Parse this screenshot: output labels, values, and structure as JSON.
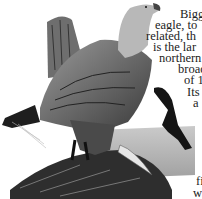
{
  "page": {
    "illustration": {
      "subject": "white-tailed eagle perched on rock with fish, second eagle in flight",
      "style": "grayscale engraving"
    },
    "text_lines": [
      {
        "text": "Bigg",
        "x": 180,
        "y": 8
      },
      {
        "text": "eagle, to",
        "x": 155,
        "y": 19
      },
      {
        "text": "related, th",
        "x": 146,
        "y": 30
      },
      {
        "text": "is the lar",
        "x": 153,
        "y": 41
      },
      {
        "text": "northern",
        "x": 159,
        "y": 52
      },
      {
        "text": "broad",
        "x": 178,
        "y": 63
      },
      {
        "text": "of 1",
        "x": 184,
        "y": 74
      },
      {
        "text": "Its a",
        "x": 187,
        "y": 86
      },
      {
        "text": "a",
        "x": 193,
        "y": 97
      },
      {
        "text": "fi",
        "x": 196,
        "y": 175
      },
      {
        "text": "w",
        "x": 193,
        "y": 187
      }
    ]
  }
}
